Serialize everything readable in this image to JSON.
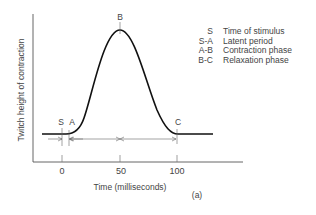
{
  "figure": {
    "panel_label": "(a)",
    "y_axis_label": "Twitch height of contraction",
    "x_axis_label": "Time (milliseconds)",
    "x_ticks": [
      {
        "label": "0",
        "value": 0
      },
      {
        "label": "50",
        "value": 50
      },
      {
        "label": "100",
        "value": 100
      }
    ],
    "points": {
      "S": {
        "label": "S",
        "time_ms": 0
      },
      "A": {
        "label": "A",
        "time_ms": 5
      },
      "B": {
        "label": "B",
        "time_ms": 50
      },
      "C": {
        "label": "C",
        "time_ms": 100
      }
    }
  },
  "legend": {
    "items": [
      {
        "key": "S",
        "description": "Time of stimulus"
      },
      {
        "key": "S-A",
        "description": "Latent period"
      },
      {
        "key": "A-B",
        "description": "Contraction phase"
      },
      {
        "key": "B-C",
        "description": "Relaxation phase"
      }
    ]
  }
}
